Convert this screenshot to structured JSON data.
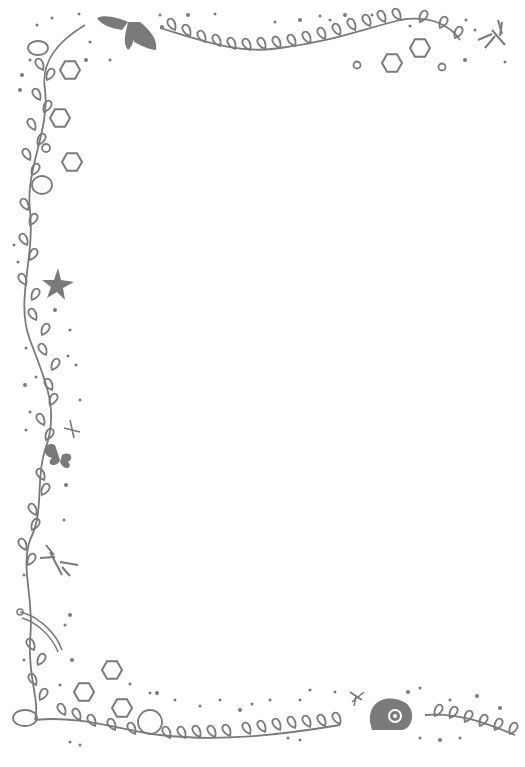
{
  "image": {
    "description": "Decorative page border with hand-drawn vines, dots, hexagons and small creatures",
    "background": "#ffffff",
    "ink_color": "#7a7a7a",
    "elements": [
      "leafy-vine-left",
      "leafy-vine-top",
      "leafy-vine-bottom",
      "moth",
      "dragonfly",
      "starfish",
      "butterfly",
      "caterpillar",
      "snail-shell",
      "hexagons",
      "dots"
    ]
  }
}
